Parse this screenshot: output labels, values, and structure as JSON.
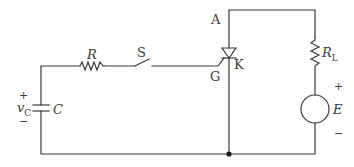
{
  "diagram": {
    "type": "circuit",
    "title": "",
    "components": {
      "capacitor": {
        "label": "C",
        "voltage_label": "v",
        "voltage_subscript": "C",
        "plus": "+",
        "minus": "−"
      },
      "resistor": {
        "label": "R"
      },
      "switch": {
        "label": "S"
      },
      "thyristor": {
        "anode": "A",
        "cathode": "K",
        "gate": "G"
      },
      "load_resistor": {
        "label": "R",
        "subscript": "L"
      },
      "source": {
        "label": "E",
        "plus": "+",
        "minus": "−"
      }
    },
    "colors": {
      "wire": "#3a3a3a",
      "background": "#ffffff"
    }
  }
}
